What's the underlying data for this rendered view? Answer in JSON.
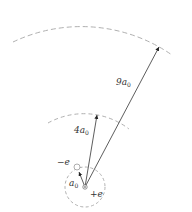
{
  "diagram": {
    "title": "",
    "nucleus": {
      "charge_label": "+e"
    },
    "electron": {
      "charge_label": "−e"
    },
    "orbits": [
      {
        "label_main": "a",
        "label_sub": "0",
        "radius_multiple": 1
      },
      {
        "label_main": "4a",
        "label_sub": "0",
        "radius_multiple": 4
      },
      {
        "label_main": "9a",
        "label_sub": "0",
        "radius_multiple": 9
      }
    ],
    "colors": {
      "line": "#333333",
      "dashed": "#aaaaaa"
    }
  }
}
